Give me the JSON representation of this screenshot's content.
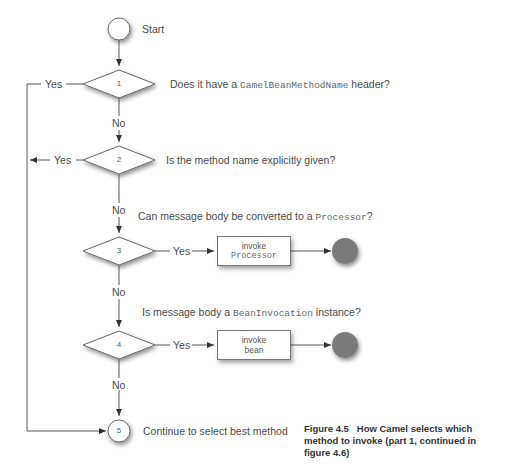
{
  "diagram": {
    "start_label": "Start",
    "nodes": [
      {
        "id": "1",
        "question_pre": "Does it have a ",
        "question_code": "CamelBeanMethodName",
        "question_post": " header?"
      },
      {
        "id": "2",
        "question_pre": "Is the method name explicitly given?",
        "question_code": "",
        "question_post": ""
      },
      {
        "id": "3",
        "question_pre": "Can message body be converted to a ",
        "question_code": "Processor",
        "question_post": "?"
      },
      {
        "id": "4",
        "question_pre": "Is message body a ",
        "question_code": "BeanInvocation",
        "question_post": " instance?"
      },
      {
        "id": "5",
        "label": "Continue to select best method"
      }
    ],
    "edges": {
      "yes": "Yes",
      "no": "No"
    },
    "actions": [
      {
        "line1": "invoke",
        "line2": "Processor",
        "line2_code": true
      },
      {
        "line1": "invoke",
        "line2": "bean",
        "line2_code": false
      }
    ],
    "colors": {
      "line": "#555555",
      "end_node": "#7a7a7a",
      "text": "#4a4a4a"
    }
  },
  "caption": {
    "figure": "Figure 4.5",
    "text": "How Camel selects which method to invoke (part 1, continued in figure 4.6)"
  }
}
